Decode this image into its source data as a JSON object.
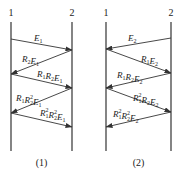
{
  "diagrams": [
    {
      "caption": "(1)",
      "surfaces": [
        {
          "label": "1",
          "x": 11
        },
        {
          "label": "2",
          "x": 72
        }
      ],
      "arrows": [
        {
          "label": "E1",
          "parts": [
            [
              "E",
              "1"
            ]
          ],
          "from": [
            11,
            39
          ],
          "to": [
            72,
            50
          ],
          "lx": 34,
          "ly": 41
        },
        {
          "label": "R2E1",
          "parts": [
            [
              "R",
              "2"
            ],
            [
              "E",
              "1"
            ]
          ],
          "from": [
            72,
            50
          ],
          "to": [
            11,
            74
          ],
          "lx": 22,
          "ly": 62
        },
        {
          "label": "R1R2E1",
          "parts": [
            [
              "R",
              "1"
            ],
            [
              "R",
              "2"
            ],
            [
              "E",
              "1"
            ]
          ],
          "from": [
            11,
            74
          ],
          "to": [
            72,
            88
          ],
          "lx": 37,
          "ly": 77
        },
        {
          "label": "R1R2^2E1",
          "parts": [
            [
              "R",
              "1"
            ],
            [
              "R",
              "2",
              "2"
            ],
            [
              "E",
              "1"
            ]
          ],
          "from": [
            72,
            88
          ],
          "to": [
            11,
            113
          ],
          "lx": 16,
          "ly": 101
        },
        {
          "label": "R1^2R2^2E1",
          "parts": [
            [
              "R",
              "1",
              "2"
            ],
            [
              "R",
              "2",
              "2"
            ],
            [
              "E",
              "1"
            ]
          ],
          "from": [
            11,
            113
          ],
          "to": [
            72,
            127
          ],
          "lx": 40,
          "ly": 116
        }
      ]
    },
    {
      "caption": "(2)",
      "surfaces": [
        {
          "label": "1",
          "x": 106
        },
        {
          "label": "2",
          "x": 171
        }
      ],
      "arrows": [
        {
          "label": "E2",
          "parts": [
            [
              "E",
              "2"
            ]
          ],
          "from": [
            171,
            38
          ],
          "to": [
            106,
            49
          ],
          "lx": 128,
          "ly": 41
        },
        {
          "label": "R1E2",
          "parts": [
            [
              "R",
              "1"
            ],
            [
              "E",
              "2"
            ]
          ],
          "from": [
            106,
            49
          ],
          "to": [
            171,
            73
          ],
          "lx": 141,
          "ly": 62
        },
        {
          "label": "R1R2E2",
          "parts": [
            [
              "R",
              "1"
            ],
            [
              "R",
              "2"
            ],
            [
              "E",
              "2"
            ]
          ],
          "from": [
            171,
            73
          ],
          "to": [
            106,
            88
          ],
          "lx": 117,
          "ly": 78
        },
        {
          "label": "R1^2R2E2",
          "parts": [
            [
              "R",
              "1",
              "2"
            ],
            [
              "R",
              "2"
            ],
            [
              "E",
              "2"
            ]
          ],
          "from": [
            106,
            88
          ],
          "to": [
            171,
            112
          ],
          "lx": 133,
          "ly": 101
        },
        {
          "label": "R1^2R2^2E2",
          "parts": [
            [
              "R",
              "1",
              "2"
            ],
            [
              "R",
              "2",
              "2"
            ],
            [
              "E",
              "2"
            ]
          ],
          "from": [
            171,
            112
          ],
          "to": [
            106,
            127
          ],
          "lx": 113,
          "ly": 117
        }
      ]
    }
  ],
  "layout": {
    "surface_top": 22,
    "surface_bottom": 151,
    "surface_label_y": 16,
    "caption_y": 166,
    "line_color": "#333333"
  }
}
